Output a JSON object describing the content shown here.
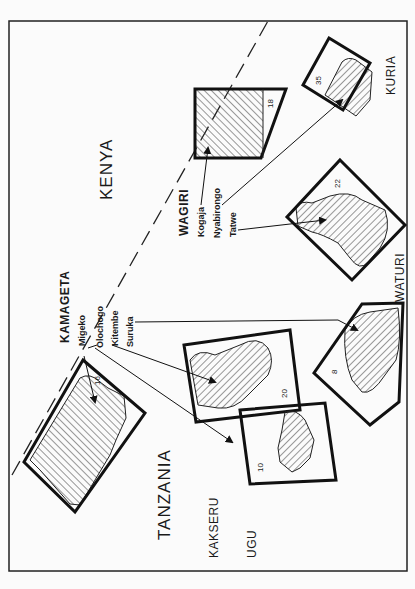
{
  "map": {
    "countries": [
      {
        "name": "KENYA"
      },
      {
        "name": "TANZANIA"
      }
    ],
    "regions": [
      {
        "name": "KURIA"
      },
      {
        "name": "WATURI"
      },
      {
        "name": "KAKSERU"
      },
      {
        "name": "UGU"
      }
    ],
    "clans": [
      {
        "name": "KAMAGETA",
        "villages": [
          "Migeko",
          "Olochogo",
          "Kitembe",
          "Suruka"
        ]
      },
      {
        "name": "WAGIRI",
        "villages": [
          "Kogaja",
          "Nyabirongo",
          "Tatwe"
        ]
      }
    ],
    "plots": [
      {
        "id": "16"
      },
      {
        "id": "20"
      },
      {
        "id": "10"
      },
      {
        "id": "8"
      },
      {
        "id": "22"
      },
      {
        "id": "18"
      },
      {
        "id": "35"
      }
    ],
    "border": {
      "style": "dashed",
      "label": "Kenya–Tanzania border"
    },
    "colors": {
      "ink": "#1a1a1a",
      "paper": "#fbfbfb"
    }
  }
}
